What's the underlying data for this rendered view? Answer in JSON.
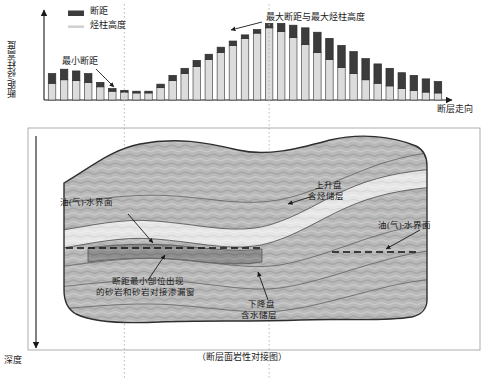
{
  "figure": {
    "caption": "（断层面岩性对接图）",
    "bottom_caption": ""
  },
  "chart_data": {
    "type": "bar",
    "title": "",
    "stacked": true,
    "xlabel": "断层走向",
    "ylabel": "断距/烃柱高度",
    "ylim": [
      0,
      100
    ],
    "grid": false,
    "legend_position": "top-left",
    "legend": [
      {
        "label": "断距",
        "color": "#3a3a3a",
        "swatch": "filled"
      },
      {
        "label": "烃柱高度",
        "color": "#d8d8d8",
        "swatch": "line"
      }
    ],
    "annotations": [
      {
        "text": "最小断距",
        "target_index": 6
      },
      {
        "text": "最大断距与最大烃柱高度",
        "target_index": 18
      }
    ],
    "series": [
      {
        "name": "烃柱高度",
        "color": "#dcdcdc",
        "values": [
          19,
          23,
          22,
          20,
          15,
          10,
          9,
          8,
          8,
          14,
          22,
          30,
          38,
          46,
          54,
          62,
          70,
          76,
          82,
          78,
          71,
          63,
          54,
          46,
          37,
          30,
          23,
          19,
          16,
          13,
          11,
          9,
          8
        ]
      },
      {
        "name": "断距",
        "color": "#3c3c3c",
        "values": [
          11,
          12,
          11,
          10,
          5,
          3,
          2,
          2,
          2,
          4,
          6,
          6,
          7,
          6,
          6,
          5,
          4,
          4,
          5,
          9,
          14,
          19,
          23,
          24,
          25,
          25,
          24,
          22,
          20,
          18,
          17,
          15,
          13
        ]
      }
    ],
    "total_values": [
      30,
      35,
      33,
      30,
      20,
      13,
      11,
      10,
      10,
      18,
      28,
      36,
      45,
      52,
      60,
      67,
      74,
      80,
      87,
      87,
      85,
      82,
      77,
      70,
      62,
      55,
      47,
      41,
      36,
      31,
      28,
      24,
      21
    ],
    "guide_lines": [
      6,
      18
    ]
  },
  "cross_section": {
    "depth_axis_label": "深度",
    "title": "（断层面岩性对接图）",
    "annotations": [
      {
        "name": "oil-water-contact-left",
        "text": "油(气)-水界面"
      },
      {
        "name": "oil-water-contact-right",
        "text": "油(气)-水界面"
      },
      {
        "name": "upthrown-block",
        "text": "上升盘\n含烃储层",
        "line1": "上升盘",
        "line2": "含烃储层"
      },
      {
        "name": "downthrown-block",
        "text": "下降盘\n含水储层",
        "line1": "下降盘",
        "line2": "含水储层"
      },
      {
        "name": "leak-window",
        "line1": "断距最小部位出现",
        "line2": "的砂岩和砂岩对接渗漏窗"
      }
    ],
    "colors": {
      "sandstone": "#b8b8b8",
      "reservoir": "#e4e4e4",
      "hydrocarbon": "#8d8d8d",
      "outline": "#3a3a3a"
    }
  }
}
